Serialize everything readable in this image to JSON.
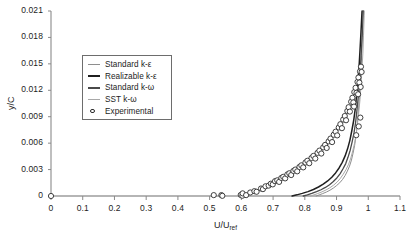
{
  "chart_data": {
    "type": "line",
    "title": "",
    "xlabel": "U/U_ref",
    "xlabel_main": "U/U",
    "xlabel_sub": "ref",
    "ylabel": "y/C",
    "xlim": [
      0,
      1.1
    ],
    "ylim": [
      0,
      0.021
    ],
    "xticks": [
      "0",
      "0.1",
      "0.2",
      "0.3",
      "0.4",
      "0.5",
      "0.6",
      "0.7",
      "0.8",
      "0.9",
      "1",
      "1.1"
    ],
    "xtick_values": [
      0,
      0.1,
      0.2,
      0.3,
      0.4,
      0.5,
      0.6,
      0.7,
      0.8,
      0.9,
      1.0,
      1.1
    ],
    "yticks": [
      "0",
      "0.003",
      "0.006",
      "0.009",
      "0.012",
      "0.015",
      "0.018",
      "0.021"
    ],
    "ytick_values": [
      0,
      0.003,
      0.006,
      0.009,
      0.012,
      0.015,
      0.018,
      0.021
    ],
    "grid": false,
    "legend_position": "upper-left-inside",
    "series": [
      {
        "name": "Standard k-ε",
        "style": "line",
        "color": "#8e8e8e",
        "width": 1.0,
        "points": [
          [
            0.836,
            0.0
          ],
          [
            0.845,
            0.00012
          ],
          [
            0.856,
            0.00027
          ],
          [
            0.868,
            0.00045
          ],
          [
            0.879,
            0.00065
          ],
          [
            0.89,
            0.0009
          ],
          [
            0.9,
            0.00118
          ],
          [
            0.91,
            0.0015
          ],
          [
            0.919,
            0.00188
          ],
          [
            0.927,
            0.00232
          ],
          [
            0.934,
            0.00282
          ],
          [
            0.941,
            0.0034
          ],
          [
            0.947,
            0.00408
          ],
          [
            0.952,
            0.00485
          ],
          [
            0.957,
            0.00575
          ],
          [
            0.961,
            0.00678
          ],
          [
            0.965,
            0.00795
          ],
          [
            0.968,
            0.00925
          ],
          [
            0.971,
            0.0107
          ],
          [
            0.974,
            0.0123
          ],
          [
            0.977,
            0.01405
          ],
          [
            0.979,
            0.01595
          ],
          [
            0.981,
            0.018
          ],
          [
            0.983,
            0.0202
          ],
          [
            0.9835,
            0.021
          ]
        ]
      },
      {
        "name": "Realizable k-ε",
        "style": "line",
        "color": "#1f1f1f",
        "width": 1.5,
        "points": [
          [
            0.76,
            0.0
          ],
          [
            0.775,
            0.00013
          ],
          [
            0.792,
            0.0003
          ],
          [
            0.81,
            0.0005
          ],
          [
            0.827,
            0.00074
          ],
          [
            0.843,
            0.00102
          ],
          [
            0.858,
            0.00134
          ],
          [
            0.872,
            0.00171
          ],
          [
            0.885,
            0.00213
          ],
          [
            0.897,
            0.00262
          ],
          [
            0.908,
            0.00318
          ],
          [
            0.918,
            0.00382
          ],
          [
            0.927,
            0.00455
          ],
          [
            0.935,
            0.00538
          ],
          [
            0.942,
            0.00632
          ],
          [
            0.948,
            0.00738
          ],
          [
            0.954,
            0.00857
          ],
          [
            0.959,
            0.0099
          ],
          [
            0.963,
            0.01136
          ],
          [
            0.967,
            0.01296
          ],
          [
            0.971,
            0.0147
          ],
          [
            0.974,
            0.01658
          ],
          [
            0.977,
            0.0186
          ],
          [
            0.98,
            0.02076
          ],
          [
            0.9805,
            0.021
          ]
        ]
      },
      {
        "name": "Standard k-ω",
        "style": "line",
        "color": "#4a4a4a",
        "width": 1.3,
        "points": [
          [
            0.795,
            0.0
          ],
          [
            0.808,
            0.00013
          ],
          [
            0.822,
            0.00029
          ],
          [
            0.837,
            0.00049
          ],
          [
            0.851,
            0.00071
          ],
          [
            0.865,
            0.00097
          ],
          [
            0.878,
            0.00128
          ],
          [
            0.89,
            0.00164
          ],
          [
            0.901,
            0.00205
          ],
          [
            0.911,
            0.00252
          ],
          [
            0.92,
            0.00306
          ],
          [
            0.929,
            0.00368
          ],
          [
            0.936,
            0.00439
          ],
          [
            0.943,
            0.0052
          ],
          [
            0.949,
            0.00612
          ],
          [
            0.955,
            0.00716
          ],
          [
            0.96,
            0.00833
          ],
          [
            0.964,
            0.00964
          ],
          [
            0.968,
            0.01109
          ],
          [
            0.972,
            0.01268
          ],
          [
            0.975,
            0.01442
          ],
          [
            0.978,
            0.01631
          ],
          [
            0.981,
            0.01834
          ],
          [
            0.984,
            0.02051
          ],
          [
            0.9845,
            0.021
          ]
        ]
      },
      {
        "name": "SST k-ω",
        "style": "line",
        "color": "#a8a8a8",
        "width": 1.0,
        "points": [
          [
            0.818,
            0.0
          ],
          [
            0.829,
            0.00013
          ],
          [
            0.841,
            0.00028
          ],
          [
            0.854,
            0.00047
          ],
          [
            0.867,
            0.00069
          ],
          [
            0.879,
            0.00094
          ],
          [
            0.891,
            0.00124
          ],
          [
            0.902,
            0.00159
          ],
          [
            0.912,
            0.002
          ],
          [
            0.921,
            0.00247
          ],
          [
            0.93,
            0.003
          ],
          [
            0.938,
            0.00361
          ],
          [
            0.945,
            0.00431
          ],
          [
            0.951,
            0.00511
          ],
          [
            0.957,
            0.00602
          ],
          [
            0.962,
            0.00705
          ],
          [
            0.966,
            0.00821
          ],
          [
            0.97,
            0.00951
          ],
          [
            0.974,
            0.01096
          ],
          [
            0.977,
            0.01256
          ],
          [
            0.98,
            0.01431
          ],
          [
            0.983,
            0.01621
          ],
          [
            0.985,
            0.01826
          ],
          [
            0.987,
            0.02045
          ],
          [
            0.9875,
            0.021
          ]
        ]
      }
    ],
    "scatter": {
      "name": "Experimental",
      "marker": "open-circle",
      "color": "#2b2b2b",
      "points": [
        [
          0.0,
          0.0
        ],
        [
          0.513,
          0.0001
        ],
        [
          0.537,
          0.0001
        ],
        [
          0.54,
          2e-05
        ],
        [
          0.598,
          0.00012
        ],
        [
          0.603,
          3e-05
        ],
        [
          0.604,
          0.0003
        ],
        [
          0.615,
          0.0001
        ],
        [
          0.628,
          0.0004
        ],
        [
          0.641,
          0.00055
        ],
        [
          0.648,
          0.00048
        ],
        [
          0.662,
          0.00085
        ],
        [
          0.668,
          0.00078
        ],
        [
          0.676,
          0.0011
        ],
        [
          0.686,
          0.00118
        ],
        [
          0.693,
          0.0014
        ],
        [
          0.699,
          0.00132
        ],
        [
          0.706,
          0.00168
        ],
        [
          0.713,
          0.00178
        ],
        [
          0.719,
          0.0016
        ],
        [
          0.726,
          0.00205
        ],
        [
          0.732,
          0.00218
        ],
        [
          0.738,
          0.002
        ],
        [
          0.745,
          0.00245
        ],
        [
          0.751,
          0.00258
        ],
        [
          0.757,
          0.00238
        ],
        [
          0.764,
          0.00285
        ],
        [
          0.77,
          0.003
        ],
        [
          0.776,
          0.0028
        ],
        [
          0.783,
          0.0033
        ],
        [
          0.789,
          0.00348
        ],
        [
          0.795,
          0.00325
        ],
        [
          0.802,
          0.0038
        ],
        [
          0.808,
          0.004
        ],
        [
          0.814,
          0.00372
        ],
        [
          0.821,
          0.00432
        ],
        [
          0.827,
          0.00455
        ],
        [
          0.833,
          0.00425
        ],
        [
          0.84,
          0.0049
        ],
        [
          0.846,
          0.00515
        ],
        [
          0.852,
          0.00482
        ],
        [
          0.858,
          0.00552
        ],
        [
          0.864,
          0.0058
        ],
        [
          0.869,
          0.00545
        ],
        [
          0.875,
          0.0062
        ],
        [
          0.881,
          0.00652
        ],
        [
          0.886,
          0.00612
        ],
        [
          0.891,
          0.00695
        ],
        [
          0.897,
          0.0073
        ],
        [
          0.902,
          0.00688
        ],
        [
          0.907,
          0.00778
        ],
        [
          0.912,
          0.00815
        ],
        [
          0.917,
          0.0077
        ],
        [
          0.921,
          0.00868
        ],
        [
          0.926,
          0.00908
        ],
        [
          0.93,
          0.0086
        ],
        [
          0.934,
          0.00965
        ],
        [
          0.938,
          0.01008
        ],
        [
          0.942,
          0.00958
        ],
        [
          0.946,
          0.0107
        ],
        [
          0.95,
          0.01115
        ],
        [
          0.953,
          0.01062
        ],
        [
          0.956,
          0.0118
        ],
        [
          0.96,
          0.01228
        ],
        [
          0.963,
          0.01172
        ],
        [
          0.966,
          0.01295
        ],
        [
          0.969,
          0.01345
        ],
        [
          0.972,
          0.01288
        ],
        [
          0.974,
          0.01415
        ],
        [
          0.977,
          0.01468
        ],
        [
          0.979,
          0.01408
        ],
        [
          0.962,
          0.0069
        ],
        [
          0.97,
          0.0079
        ],
        [
          0.975,
          0.0089
        ],
        [
          0.955,
          0.01015
        ],
        [
          0.968,
          0.01155
        ],
        [
          0.976,
          0.01238
        ]
      ]
    }
  },
  "legend": {
    "items": [
      {
        "label": "Standard k-ε",
        "swatch": "line-light"
      },
      {
        "label": "Realizable k-ε",
        "swatch": "line-dark"
      },
      {
        "label": "Standard k-ω",
        "swatch": "line-medium"
      },
      {
        "label": "SST k-ω",
        "swatch": "line-lighter"
      },
      {
        "label": "Experimental",
        "swatch": "open-circle"
      }
    ]
  },
  "axes": {
    "y_axis_title": "y/C",
    "x_axis_title_main": "U/U",
    "x_axis_title_sub": "ref"
  }
}
